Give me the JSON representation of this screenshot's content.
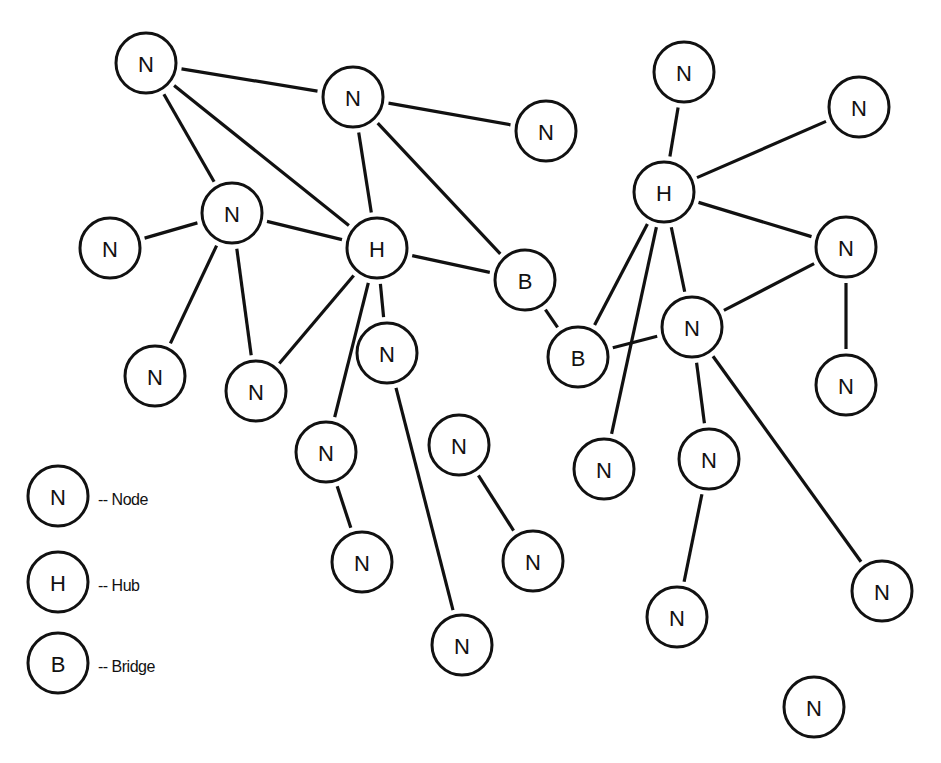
{
  "diagram": {
    "type": "network-topology",
    "node_radius": 30,
    "colors": {
      "stroke": "#111111",
      "fill": "#ffffff",
      "background": "#ffffff"
    },
    "nodes": [
      {
        "id": "n1",
        "label": "N",
        "kind": "node",
        "x": 146,
        "y": 63
      },
      {
        "id": "n2",
        "label": "N",
        "kind": "node",
        "x": 353,
        "y": 97
      },
      {
        "id": "n3",
        "label": "N",
        "kind": "node",
        "x": 546,
        "y": 131
      },
      {
        "id": "n4",
        "label": "N",
        "kind": "node",
        "x": 232,
        "y": 213
      },
      {
        "id": "n5",
        "label": "N",
        "kind": "node",
        "x": 110,
        "y": 248
      },
      {
        "id": "h1",
        "label": "H",
        "kind": "hub",
        "x": 377,
        "y": 248
      },
      {
        "id": "b1",
        "label": "B",
        "kind": "bridge",
        "x": 525,
        "y": 280
      },
      {
        "id": "n8",
        "label": "N",
        "kind": "node",
        "x": 155,
        "y": 376
      },
      {
        "id": "n9",
        "label": "N",
        "kind": "node",
        "x": 256,
        "y": 391
      },
      {
        "id": "n10",
        "label": "N",
        "kind": "node",
        "x": 387,
        "y": 353
      },
      {
        "id": "b2",
        "label": "B",
        "kind": "bridge",
        "x": 578,
        "y": 357
      },
      {
        "id": "n12",
        "label": "N",
        "kind": "node",
        "x": 326,
        "y": 452
      },
      {
        "id": "n13",
        "label": "N",
        "kind": "node",
        "x": 362,
        "y": 562
      },
      {
        "id": "n14",
        "label": "N",
        "kind": "node",
        "x": 459,
        "y": 445
      },
      {
        "id": "n15",
        "label": "N",
        "kind": "node",
        "x": 533,
        "y": 561
      },
      {
        "id": "n16",
        "label": "N",
        "kind": "node",
        "x": 462,
        "y": 645
      },
      {
        "id": "r1",
        "label": "N",
        "kind": "node",
        "x": 684,
        "y": 72
      },
      {
        "id": "r2",
        "label": "N",
        "kind": "node",
        "x": 859,
        "y": 107
      },
      {
        "id": "h2",
        "label": "H",
        "kind": "hub",
        "x": 664,
        "y": 192
      },
      {
        "id": "r4",
        "label": "N",
        "kind": "node",
        "x": 846,
        "y": 247
      },
      {
        "id": "r5",
        "label": "N",
        "kind": "node",
        "x": 692,
        "y": 327
      },
      {
        "id": "r6",
        "label": "N",
        "kind": "node",
        "x": 846,
        "y": 385
      },
      {
        "id": "r7",
        "label": "N",
        "kind": "node",
        "x": 604,
        "y": 469
      },
      {
        "id": "r8",
        "label": "N",
        "kind": "node",
        "x": 709,
        "y": 459
      },
      {
        "id": "r9",
        "label": "N",
        "kind": "node",
        "x": 677,
        "y": 617
      },
      {
        "id": "r10",
        "label": "N",
        "kind": "node",
        "x": 882,
        "y": 591
      },
      {
        "id": "r11",
        "label": "N",
        "kind": "node",
        "x": 814,
        "y": 707
      }
    ],
    "edges": [
      [
        "n1",
        "n2"
      ],
      [
        "n1",
        "n4"
      ],
      [
        "n1",
        "h1"
      ],
      [
        "n2",
        "n3"
      ],
      [
        "n2",
        "h1"
      ],
      [
        "n2",
        "b1"
      ],
      [
        "n4",
        "n5"
      ],
      [
        "n4",
        "h1"
      ],
      [
        "n4",
        "n8"
      ],
      [
        "n4",
        "n9"
      ],
      [
        "h1",
        "b1"
      ],
      [
        "h1",
        "n9"
      ],
      [
        "h1",
        "n10"
      ],
      [
        "h1",
        "n12"
      ],
      [
        "b1",
        "b2"
      ],
      [
        "n10",
        "n16"
      ],
      [
        "n12",
        "n13"
      ],
      [
        "n14",
        "n15"
      ],
      [
        "r1",
        "h2"
      ],
      [
        "h2",
        "r2"
      ],
      [
        "h2",
        "r4"
      ],
      [
        "h2",
        "r5"
      ],
      [
        "h2",
        "b2"
      ],
      [
        "h2",
        "r7"
      ],
      [
        "b2",
        "r5"
      ],
      [
        "r5",
        "r4"
      ],
      [
        "r4",
        "r6"
      ],
      [
        "r5",
        "r8"
      ],
      [
        "r5",
        "r10"
      ],
      [
        "r8",
        "r9"
      ]
    ]
  },
  "legend": {
    "items": [
      {
        "symbol": "N",
        "label": "-- Node",
        "x": 58,
        "y": 496
      },
      {
        "symbol": "H",
        "label": "-- Hub",
        "x": 58,
        "y": 582
      },
      {
        "symbol": "B",
        "label": "-- Bridge",
        "x": 58,
        "y": 663
      }
    ]
  }
}
